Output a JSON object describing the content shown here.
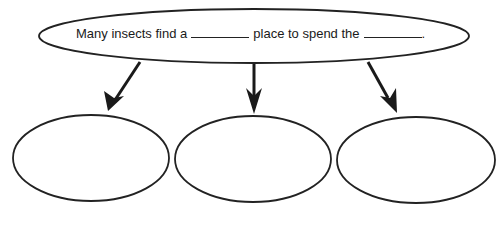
{
  "diagram": {
    "type": "graphic-organizer",
    "stroke_color": "#222222",
    "background_color": "#ffffff",
    "main_idea": {
      "text_part_1": "Many insects find a",
      "blank_1": "",
      "text_part_2": "place to spend the",
      "blank_2": "",
      "text_end": "."
    },
    "branches": [
      {
        "label": "",
        "arrow": "down-left"
      },
      {
        "label": "",
        "arrow": "down"
      },
      {
        "label": "",
        "arrow": "down-right"
      }
    ]
  }
}
